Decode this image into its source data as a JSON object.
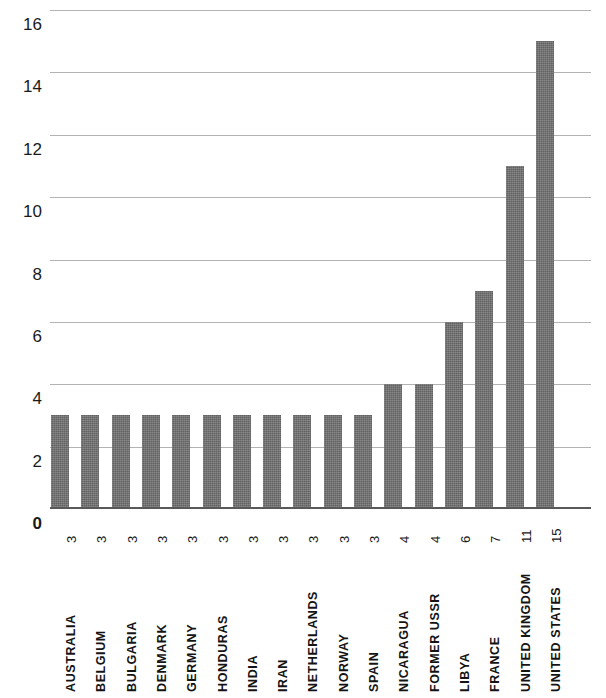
{
  "chart_data": {
    "type": "bar",
    "title": "",
    "subtitle": "",
    "xlabel": "",
    "ylabel": "",
    "orientation": "vertical",
    "grid": true,
    "legend": false,
    "legend_position": "none",
    "ylim": [
      0,
      16
    ],
    "y_ticks": [
      0,
      2,
      4,
      6,
      8,
      10,
      12,
      14,
      16
    ],
    "y_tick_labels": [
      "0",
      "2",
      "4",
      "6",
      "8",
      "10",
      "12",
      "14",
      "16"
    ],
    "bar_color": "#6e6e6e",
    "gridline_color": "#b3b3b3",
    "axis_color": "#595959",
    "categories": [
      "AUSTRALIA",
      "BELGIUM",
      "BULGARIA",
      "DENMARK",
      "GERMANY",
      "HONDURAS",
      "INDIA",
      "IRAN",
      "NETHERLANDS",
      "NORWAY",
      "SPAIN",
      "NICARAGUA",
      "FORMER USSR",
      "LIBYA",
      "FRANCE",
      "UNITED KINGDOM",
      "UNITED STATES"
    ],
    "values": [
      3,
      3,
      3,
      3,
      3,
      3,
      3,
      3,
      3,
      3,
      3,
      4,
      4,
      6,
      7,
      11,
      15
    ],
    "value_labels": [
      "3",
      "3",
      "3",
      "3",
      "3",
      "3",
      "3",
      "3",
      "3",
      "3",
      "3",
      "4",
      "4",
      "6",
      "7",
      "11",
      "15"
    ]
  }
}
